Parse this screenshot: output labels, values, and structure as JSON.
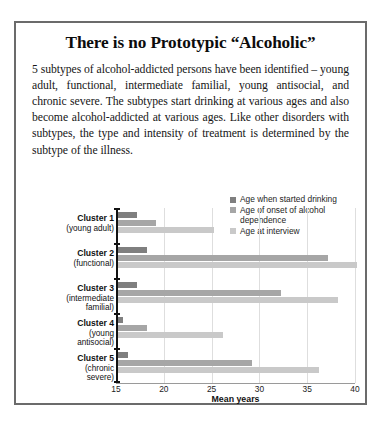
{
  "document": {
    "title": "There is no Prototypic “Alcoholic”",
    "body": "5 subtypes of alcohol-addicted persons have been identified – young adult, functional, intermediate familial, young antisocial, and chronic severe.  The subtypes start drinking at various ages and also become alcohol-addicted at various ages.  Like other disorders with subtypes, the type and intensity of treatment is determined by the subtype of the illness."
  },
  "colors": {
    "series_started_drinking": "#7f7f7f",
    "series_onset_dependence": "#a6a6a6",
    "series_age_at_interview": "#c9c9c9",
    "axis": "#121212",
    "grid": "#dedede",
    "frame": "#6b6b6b"
  },
  "chart_data": {
    "type": "bar",
    "orientation": "horizontal",
    "title": "",
    "xlabel": "Mean years",
    "ylabel": "",
    "xlim": [
      15,
      40
    ],
    "xticks": [
      15,
      20,
      25,
      30,
      35,
      40
    ],
    "grid": true,
    "legend_position": "top-right",
    "categories": [
      "Cluster 1 (young adult)",
      "Cluster 2 (functional)",
      "Cluster 3 (intermediate familial)",
      "Cluster 4 (young antisocial)",
      "Cluster 5 (chronic severe)"
    ],
    "category_labels": [
      {
        "name": "Cluster 1",
        "sub": "(young adult)"
      },
      {
        "name": "Cluster 2",
        "sub": "(functional)"
      },
      {
        "name": "Cluster 3",
        "sub": "(intermediate\nfamilial)"
      },
      {
        "name": "Cluster 4",
        "sub": "(young\nantisocial)"
      },
      {
        "name": "Cluster 5",
        "sub": "(chronic\nsevere)"
      }
    ],
    "series": [
      {
        "name": "Age when started drinking",
        "color": "#7f7f7f",
        "values": [
          17.0,
          18.0,
          17.0,
          15.5,
          16.0
        ]
      },
      {
        "name": "Age of onset of alcohol dependence",
        "color": "#a6a6a6",
        "values": [
          19.0,
          37.0,
          32.0,
          18.0,
          29.0
        ]
      },
      {
        "name": "Age at interview",
        "color": "#c9c9c9",
        "values": [
          25.0,
          40.0,
          38.0,
          26.0,
          36.0
        ]
      }
    ]
  }
}
